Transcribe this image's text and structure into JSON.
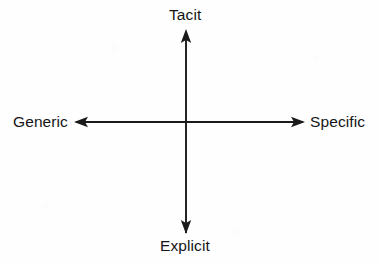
{
  "figure": {
    "background_color": "#fefefe",
    "stroke_color": "#1a1a1a",
    "text_color": "#151515"
  },
  "chart_data": {
    "type": "diagram",
    "subtype": "two-axis-quadrant-scale",
    "title": "",
    "grid": false,
    "legend": false,
    "axes": [
      {
        "id": "vertical",
        "orientation": "vertical",
        "double_headed": true,
        "positive_end_label": "Tacit",
        "negative_end_label": "Explicit",
        "start_point": [
          186,
          33
        ],
        "end_point": [
          186,
          233
        ]
      },
      {
        "id": "horizontal",
        "orientation": "horizontal",
        "double_headed": true,
        "positive_end_label": "Specific",
        "negative_end_label": "Generic",
        "start_point": [
          76,
          122
        ],
        "end_point": [
          303,
          122
        ]
      }
    ],
    "origin": [
      186,
      122
    ],
    "labels": {
      "top": "Tacit",
      "bottom": "Explicit",
      "left": "Generic",
      "right": "Specific"
    },
    "annotations": [],
    "series": [],
    "data_points": []
  },
  "labels": {
    "top": "Tacit",
    "bottom": "Explicit",
    "left": "Generic",
    "right": "Specific"
  }
}
